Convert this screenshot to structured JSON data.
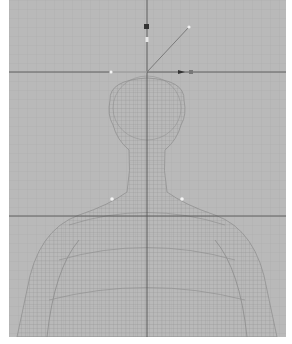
{
  "viewport": {
    "name": "3D perspective viewport",
    "background_color": "#b9b9b9",
    "grid_color": "#a9a9a9",
    "axis_line_color": "#555555",
    "wireframe_color": "#8f8f8f",
    "model": "human bust wireframe (head, neck, shoulders)",
    "rig": {
      "camera_marker_color": "#333333",
      "handle_color": "#eeeeee",
      "aim_line_color": "#7a7a7a"
    }
  }
}
